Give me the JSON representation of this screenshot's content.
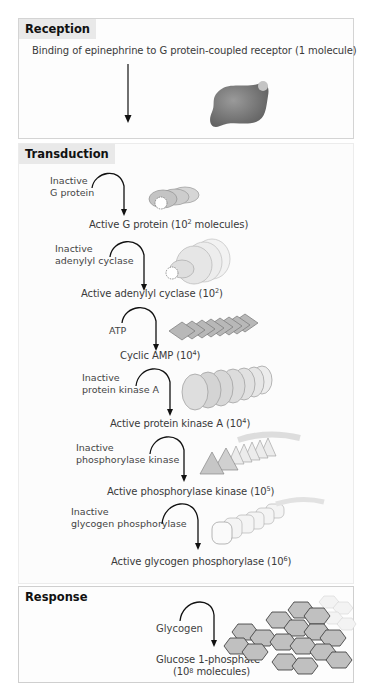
{
  "reception": {
    "title": "Reception",
    "caption": "Binding of epinephrine to G protein-coupled receptor (1 molecule)"
  },
  "transduction": {
    "title": "Transduction",
    "steps": [
      {
        "input_line1": "Inactive",
        "input_line2": "G protein",
        "output": "Active G protein (10",
        "exp": "2",
        "output_tail": " molecules)",
        "icon": "g-protein-icon"
      },
      {
        "input_line1": "Inactive",
        "input_line2": "adenylyl cyclase",
        "output": "Active adenylyl cyclase (10",
        "exp": "2",
        "output_tail": ")",
        "icon": "adenylyl-cyclase-icon"
      },
      {
        "input_line1": "ATP",
        "input_line2": "",
        "output": "Cyclic AMP (10",
        "exp": "4",
        "output_tail": ")",
        "icon": "cyclic-amp-icon"
      },
      {
        "input_line1": "Inactive",
        "input_line2": "protein kinase A",
        "output": "Active protein kinase A (10",
        "exp": "4",
        "output_tail": ")",
        "icon": "protein-kinase-a-icon"
      },
      {
        "input_line1": "Inactive",
        "input_line2": "phosphorylase kinase",
        "output": "Active phosphorylase kinase (10",
        "exp": "5",
        "output_tail": ")",
        "icon": "phosphorylase-kinase-icon"
      },
      {
        "input_line1": "Inactive",
        "input_line2": "glycogen phosphorylase",
        "output": "Active glycogen phosphorylase (10",
        "exp": "6",
        "output_tail": ")",
        "icon": "glycogen-phosphorylase-icon"
      }
    ]
  },
  "response": {
    "title": "Response",
    "input": "Glycogen",
    "output_line1": "Glucose 1-phosphate",
    "output_line2_pre": "(10",
    "output_line2_exp": "8",
    "output_line2_tail": " molecules)"
  },
  "colors": {
    "header_bg": "#e9e9e9",
    "border": "#d4d4d4",
    "arrow": "#111111",
    "molecule_gray": "#8c8c8c"
  }
}
